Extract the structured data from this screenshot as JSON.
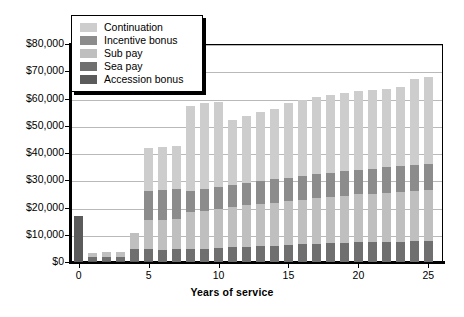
{
  "chart_data": {
    "type": "bar",
    "stacked": true,
    "title": "",
    "xlabel": "Years of service",
    "ylabel": "",
    "xlim": [
      -0.6,
      25.6
    ],
    "ylim": [
      0,
      80000
    ],
    "grid": true,
    "legend_position": "top-left",
    "x_tick_labels": [
      "0",
      "5",
      "10",
      "15",
      "20",
      "25"
    ],
    "x_tick_values": [
      0,
      5,
      10,
      15,
      20,
      25
    ],
    "y_tick_labels": [
      "$0",
      "$10,000",
      "$20,000",
      "$30,000",
      "$40,000",
      "$50,000",
      "$60,000",
      "$70,000",
      "$80,000"
    ],
    "y_tick_values": [
      0,
      10000,
      20000,
      30000,
      40000,
      50000,
      60000,
      70000,
      80000
    ],
    "categories": [
      0,
      1,
      2,
      3,
      4,
      5,
      6,
      7,
      8,
      9,
      10,
      11,
      12,
      13,
      14,
      15,
      16,
      17,
      18,
      19,
      20,
      21,
      22,
      23,
      24,
      25
    ],
    "series": [
      {
        "name": "Accession bonus",
        "color": "#5b5b5b",
        "values": [
          17000,
          500,
          500,
          500,
          500,
          500,
          0,
          0,
          0,
          0,
          0,
          0,
          0,
          0,
          0,
          0,
          0,
          0,
          0,
          0,
          0,
          0,
          0,
          0,
          0,
          0
        ]
      },
      {
        "name": "Sea pay",
        "color": "#6f6f6f",
        "values": [
          0,
          1200,
          1300,
          1400,
          4200,
          4400,
          4500,
          4600,
          4700,
          4800,
          5200,
          5400,
          5600,
          5800,
          6000,
          6300,
          6500,
          6700,
          6900,
          7100,
          7200,
          7300,
          7400,
          7500,
          7600,
          7700
        ]
      },
      {
        "name": "Sub pay",
        "color": "#bfbfbf",
        "values": [
          0,
          1600,
          1700,
          1900,
          6100,
          10600,
          10900,
          11200,
          13600,
          14000,
          14400,
          14800,
          15200,
          15500,
          15800,
          16100,
          16400,
          16700,
          17000,
          17300,
          17600,
          17800,
          18000,
          18200,
          18400,
          18600
        ]
      },
      {
        "name": "Incentive bonus",
        "color": "#8c8c8c",
        "values": [
          0,
          0,
          0,
          0,
          0,
          10400,
          10900,
          11000,
          7900,
          8000,
          8100,
          8200,
          8300,
          8400,
          8500,
          8600,
          8700,
          8800,
          8900,
          9000,
          9100,
          9200,
          9300,
          9400,
          9500,
          9600
        ]
      },
      {
        "name": "Continuation",
        "color": "#cdcdcd",
        "values": [
          0,
          0,
          0,
          0,
          0,
          15900,
          15900,
          15900,
          31000,
          31500,
          31000,
          23600,
          24500,
          25400,
          26000,
          27200,
          28000,
          28300,
          28400,
          28500,
          28700,
          28800,
          28900,
          29000,
          31500,
          31900
        ]
      }
    ],
    "series_order_bottom_to_top": [
      "Accession bonus",
      "Sea pay",
      "Sub pay",
      "Incentive bonus",
      "Continuation"
    ],
    "legend_entries": [
      {
        "label": "Continuation",
        "color": "#cdcdcd"
      },
      {
        "label": "Incentive bonus",
        "color": "#8c8c8c"
      },
      {
        "label": "Sub pay",
        "color": "#bfbfbf"
      },
      {
        "label": "Sea pay",
        "color": "#6f6f6f"
      },
      {
        "label": "Accession bonus",
        "color": "#5b5b5b"
      }
    ]
  }
}
